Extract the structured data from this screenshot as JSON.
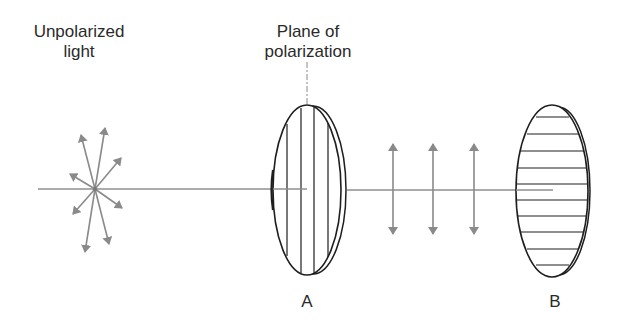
{
  "diagram": {
    "title_labels": {
      "unpolarized": [
        "Unpolarized",
        "light"
      ],
      "plane": [
        "Plane of",
        "polarization"
      ]
    },
    "polarizers": [
      {
        "id": "A",
        "label": "A",
        "grating": "vertical"
      },
      {
        "id": "B",
        "label": "B",
        "grating": "horizontal"
      }
    ],
    "colors": {
      "ink": "#1e1e1e",
      "arrow": "#8a8a8a",
      "beam": "#8f8f8f",
      "background": "#ffffff"
    }
  }
}
